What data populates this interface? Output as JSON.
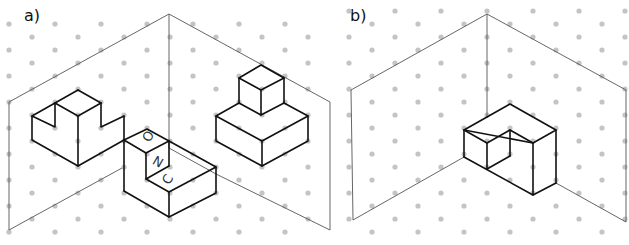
{
  "figures": [
    {
      "id": "a",
      "label": "a)",
      "description": "Isometric corner (two walls) on dot grid with three objects: notched block on left wall, L-shaped block with letters at corner, stepped block (cube on slab) on right",
      "letters": [
        "O",
        "N",
        "C"
      ]
    },
    {
      "id": "b",
      "label": "b)",
      "description": "Isometric corner (two walls) on dot grid with a single notched L-shaped block near the corner"
    }
  ],
  "colors": {
    "background": "#ffffff",
    "outline": "#111111",
    "corner_lines": "#555555",
    "grid_dots": "#c4c4c4"
  }
}
